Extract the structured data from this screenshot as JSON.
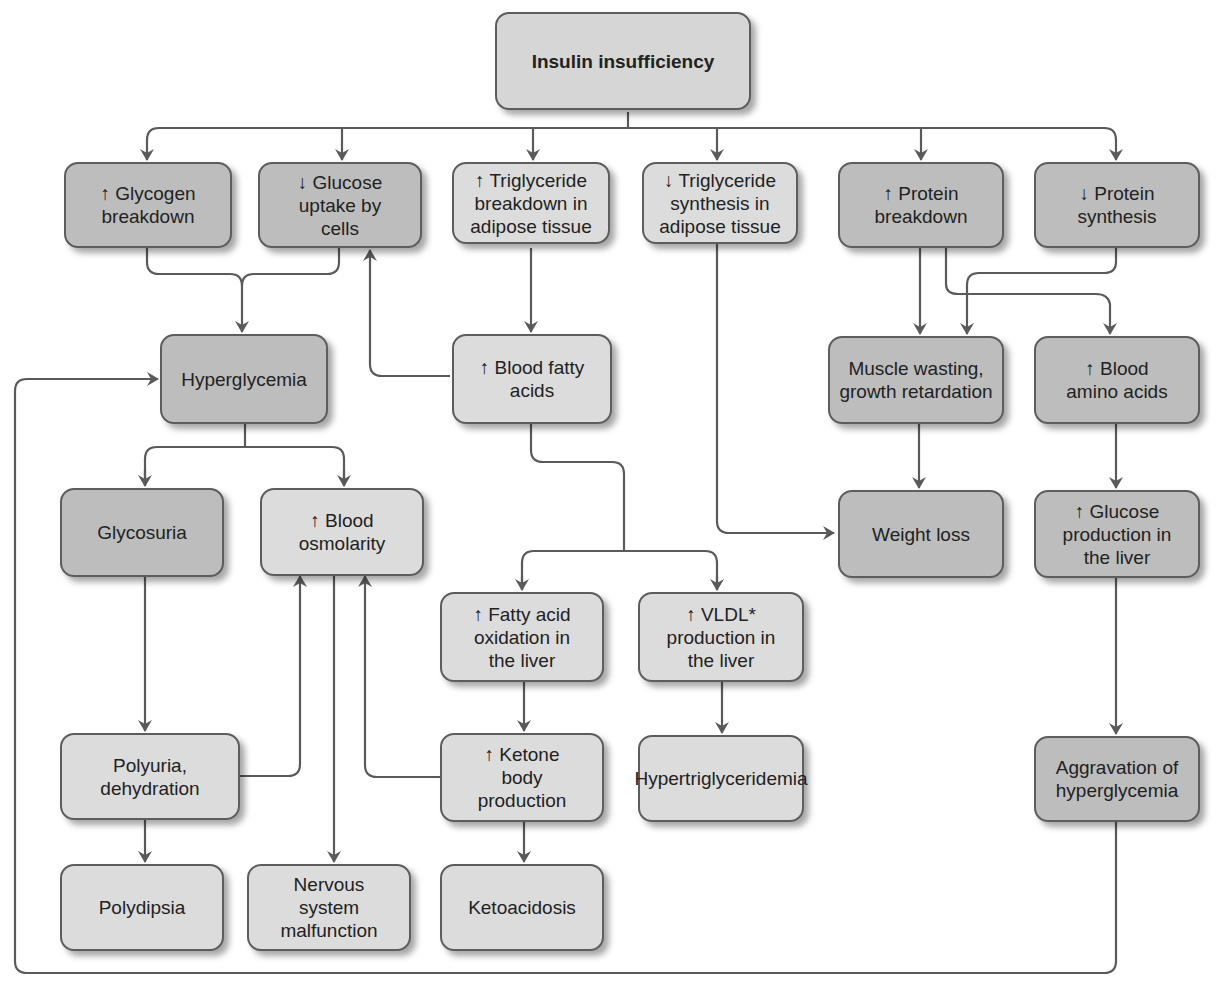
{
  "diagram": {
    "title": "Insulin insufficiency",
    "colors": {
      "line": "#5a5a5a",
      "dark_box": "#bdbdbd",
      "light_box": "#dcdcdc",
      "border": "#5d5d5d"
    },
    "nodes": {
      "insulin_insufficiency": "Insulin insufficiency",
      "glycogen_breakdown": "↑ Glycogen\nbreakdown",
      "glucose_uptake": "↓ Glucose\nuptake by\ncells",
      "tg_breakdown": "↑ Triglyceride\nbreakdown in\nadipose tissue",
      "tg_synthesis": "↓ Triglyceride\nsynthesis in\nadipose tissue",
      "protein_breakdown": "↑ Protein\nbreakdown",
      "protein_synthesis": "↓ Protein\nsynthesis",
      "hyperglycemia": "Hyperglycemia",
      "blood_fatty_acids": "↑ Blood fatty\nacids",
      "muscle_wasting": "Muscle wasting,\ngrowth retardation",
      "blood_amino_acids": "↑ Blood\namino acids",
      "glycosuria": "Glycosuria",
      "blood_osmolarity": "↑ Blood\nosmolarity",
      "weight_loss": "Weight loss",
      "glucose_production_liver": "↑ Glucose\nproduction in\nthe liver",
      "fatty_acid_oxidation": "↑ Fatty acid\noxidation in\nthe liver",
      "vldl_production": "↑ VLDL*\nproduction in\nthe liver",
      "polyuria": "Polyuria,\ndehydration",
      "ketone_production": "↑ Ketone\nbody\nproduction",
      "hypertriglyceridemia": "Hypertriglyceridemia",
      "aggravation_hyperglycemia": "Aggravation of\nhyperglycemia",
      "polydipsia": "Polydipsia",
      "nervous_system": "Nervous\nsystem\nmalfunction",
      "ketoacidosis": "Ketoacidosis"
    },
    "edges": [
      [
        "insulin_insufficiency",
        "glycogen_breakdown"
      ],
      [
        "insulin_insufficiency",
        "glucose_uptake"
      ],
      [
        "insulin_insufficiency",
        "tg_breakdown"
      ],
      [
        "insulin_insufficiency",
        "tg_synthesis"
      ],
      [
        "insulin_insufficiency",
        "protein_breakdown"
      ],
      [
        "insulin_insufficiency",
        "protein_synthesis"
      ],
      [
        "glycogen_breakdown",
        "hyperglycemia"
      ],
      [
        "glucose_uptake",
        "hyperglycemia"
      ],
      [
        "blood_fatty_acids",
        "glucose_uptake"
      ],
      [
        "tg_breakdown",
        "blood_fatty_acids"
      ],
      [
        "tg_synthesis",
        "weight_loss"
      ],
      [
        "protein_breakdown",
        "muscle_wasting"
      ],
      [
        "protein_synthesis",
        "muscle_wasting"
      ],
      [
        "protein_breakdown",
        "blood_amino_acids"
      ],
      [
        "hyperglycemia",
        "glycosuria"
      ],
      [
        "hyperglycemia",
        "blood_osmolarity"
      ],
      [
        "blood_fatty_acids",
        "fatty_acid_oxidation"
      ],
      [
        "blood_fatty_acids",
        "vldl_production"
      ],
      [
        "muscle_wasting",
        "weight_loss"
      ],
      [
        "blood_amino_acids",
        "glucose_production_liver"
      ],
      [
        "glycosuria",
        "polyuria"
      ],
      [
        "polyuria",
        "blood_osmolarity"
      ],
      [
        "polyuria",
        "polydipsia"
      ],
      [
        "blood_osmolarity",
        "nervous_system"
      ],
      [
        "ketone_production",
        "blood_osmolarity"
      ],
      [
        "fatty_acid_oxidation",
        "ketone_production"
      ],
      [
        "ketone_production",
        "ketoacidosis"
      ],
      [
        "vldl_production",
        "hypertriglyceridemia"
      ],
      [
        "glucose_production_liver",
        "aggravation_hyperglycemia"
      ],
      [
        "aggravation_hyperglycemia",
        "hyperglycemia"
      ]
    ]
  }
}
